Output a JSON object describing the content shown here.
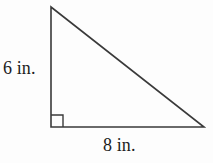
{
  "figure": {
    "kind": "right-triangle-diagram",
    "background_color": "#fdfdfd",
    "stroke_color": "#3a3a3a",
    "text_color": "#1c1c1c",
    "stroke_width": 1.6,
    "vertices": {
      "top": {
        "x": 51,
        "y": 7
      },
      "bottom_left": {
        "x": 51,
        "y": 127
      },
      "bottom_right": {
        "x": 204,
        "y": 127
      }
    },
    "right_angle_marker": {
      "at_vertex": "bottom_left",
      "size": 12
    },
    "labels": {
      "vertical_leg": "6 in.",
      "horizontal_leg": "8 in."
    }
  }
}
